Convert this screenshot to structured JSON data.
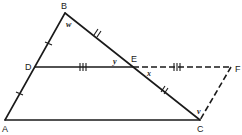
{
  "diagram": {
    "points": {
      "A": {
        "label": "A",
        "x": 5,
        "y": 120
      },
      "B": {
        "label": "B",
        "x": 65,
        "y": 13
      },
      "C": {
        "label": "C",
        "x": 200,
        "y": 120
      },
      "D": {
        "label": "D",
        "x": 35,
        "y": 67
      },
      "E": {
        "label": "E",
        "x": 133,
        "y": 67
      },
      "F": {
        "label": "F",
        "x": 231,
        "y": 67
      }
    },
    "angles": {
      "w": "w",
      "y": "y",
      "x": "x",
      "v": "v"
    },
    "segments": [
      {
        "from": "A",
        "to": "B",
        "style": "solid",
        "ticks": "1 (AD = DB)"
      },
      {
        "from": "B",
        "to": "C",
        "style": "solid",
        "ticks": "2 (BE = EC)"
      },
      {
        "from": "A",
        "to": "C",
        "style": "solid"
      },
      {
        "from": "D",
        "to": "E",
        "style": "solid",
        "ticks": "3 (DE = EF)"
      },
      {
        "from": "E",
        "to": "F",
        "style": "dashed",
        "ticks": "3"
      },
      {
        "from": "F",
        "to": "C",
        "style": "dashed"
      }
    ]
  }
}
